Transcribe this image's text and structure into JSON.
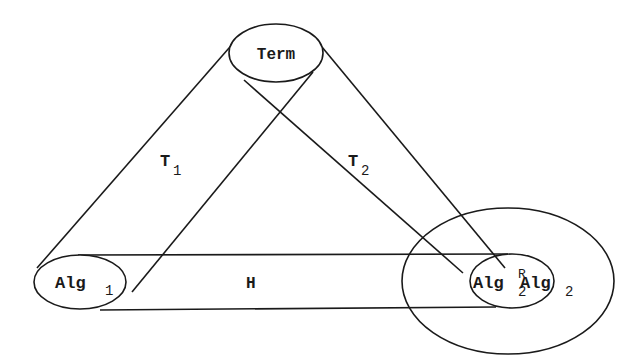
{
  "diagram": {
    "background": "#ffffff",
    "stroke_color": "#1a1a1a",
    "nodes": {
      "term": {
        "label": "Term",
        "cx": 276,
        "cy": 54,
        "rx": 47,
        "ry": 29
      },
      "alg1": {
        "label": "Alg",
        "sub": "1",
        "cx": 80,
        "cy": 282,
        "rx": 46,
        "ry": 27
      },
      "alg2r": {
        "label": "Alg",
        "sup": "R",
        "sub": "2",
        "cx": 512,
        "cy": 281,
        "rx": 42,
        "ry": 27
      },
      "alg2": {
        "label": "Alg",
        "sub": "2",
        "cx": 508,
        "cy": 281,
        "rx": 106,
        "ry": 73
      }
    },
    "edges": {
      "t1": {
        "label": "T",
        "sub": "1",
        "from": "alg1",
        "to": "term"
      },
      "t2": {
        "label": "T",
        "sub": "2",
        "from": "alg2r",
        "to": "term"
      },
      "h": {
        "label": "H",
        "from": "alg1",
        "to": "alg2r"
      }
    }
  }
}
